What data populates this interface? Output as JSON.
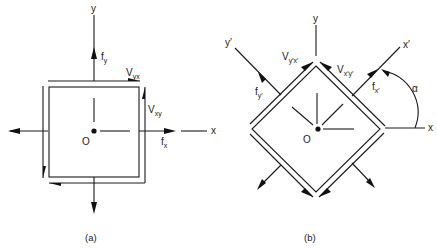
{
  "figure": {
    "panel_a": {
      "caption": "(a)",
      "axis_x": "x",
      "axis_y": "y",
      "origin": "O",
      "labels": {
        "fy_main": "f",
        "fy_sub": "y",
        "fx_main": "f",
        "fx_sub": "x",
        "vyx_main": "V",
        "vyx_sub": "yx",
        "vxy_main": "V",
        "vxy_sub": "xy"
      }
    },
    "panel_b": {
      "caption": "(b)",
      "axis_x": "x",
      "axis_y": "y",
      "axis_xp": "x′",
      "axis_yp": "y′",
      "origin": "O",
      "angle": "α",
      "labels": {
        "fyp_main": "f",
        "fyp_sub": "y′",
        "fxp_main": "f",
        "fxp_sub": "x′",
        "vypxp_main": "V",
        "vypxp_sub": "y′x′",
        "vxpyp_main": "V",
        "vxpyp_sub": "x′y′"
      }
    },
    "colors": {
      "ink": "#1a1a1a",
      "background": "#ffffff"
    }
  }
}
